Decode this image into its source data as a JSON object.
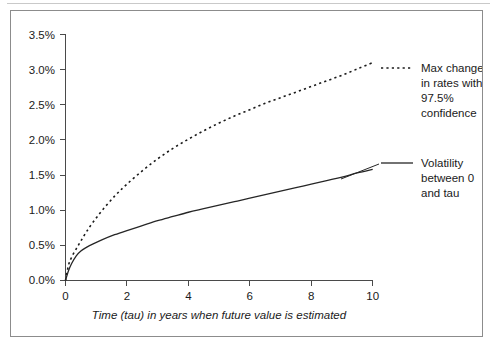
{
  "chart_data": {
    "type": "line",
    "title": "",
    "xlabel": "Time (tau) in years when future value is estimated",
    "ylabel": "",
    "xlim": [
      0,
      10
    ],
    "ylim": [
      0,
      3.5
    ],
    "grid": false,
    "legend_position": "right",
    "x_ticks": [
      "0",
      "2",
      "4",
      "6",
      "8",
      "10"
    ],
    "x_tick_values": [
      0,
      2,
      4,
      6,
      8,
      10
    ],
    "y_ticks": [
      "0.0%",
      "0.5%",
      "1.0%",
      "1.5%",
      "2.0%",
      "2.5%",
      "3.0%",
      "3.5%"
    ],
    "y_tick_values": [
      0.0,
      0.5,
      1.0,
      1.5,
      2.0,
      2.5,
      3.0,
      3.5
    ],
    "x": [
      0,
      0.1,
      0.2,
      0.35,
      0.5,
      0.68,
      0.9,
      1.2,
      1.6,
      2,
      2.5,
      3,
      3.5,
      4,
      4.5,
      5,
      5.5,
      6,
      6.5,
      7,
      7.5,
      8,
      8.5,
      9,
      9.5,
      10
    ],
    "series": [
      {
        "name": "Max change in rates with 97.5% confidence",
        "style": "dotted",
        "values": [
          0.0,
          0.22,
          0.33,
          0.45,
          0.56,
          0.69,
          0.83,
          1.0,
          1.2,
          1.37,
          1.56,
          1.73,
          1.88,
          2.01,
          2.13,
          2.24,
          2.34,
          2.43,
          2.52,
          2.6,
          2.68,
          2.76,
          2.84,
          2.92,
          3.01,
          3.1
        ]
      },
      {
        "name": "Volatility between 0 and tau",
        "style": "solid",
        "values": [
          0.0,
          0.14,
          0.24,
          0.35,
          0.42,
          0.47,
          0.52,
          0.58,
          0.65,
          0.71,
          0.78,
          0.85,
          0.91,
          0.97,
          1.02,
          1.07,
          1.12,
          1.17,
          1.22,
          1.27,
          1.32,
          1.37,
          1.42,
          1.47,
          1.53,
          1.58
        ]
      }
    ],
    "legend": [
      {
        "style": "dotted",
        "lines": [
          "Max change",
          "in rates with",
          "97.5%",
          "confidence"
        ]
      },
      {
        "style": "solid",
        "lines": [
          "Volatility",
          "between 0",
          "and tau"
        ]
      }
    ],
    "colors": {
      "series_solid": "#262626",
      "series_dotted": "#1a1a1a",
      "axis": "#4a4a4a",
      "text": "#1a1a1a",
      "frame": "#8c8c8c",
      "background": "#ffffff"
    }
  }
}
